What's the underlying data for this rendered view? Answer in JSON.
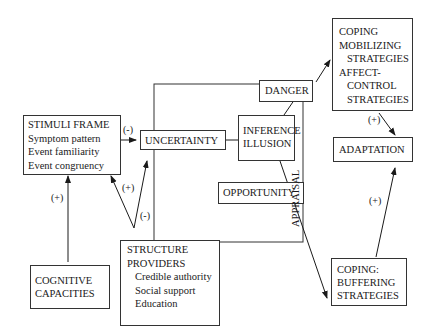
{
  "nodes": {
    "stimuli_frame": {
      "title": "STIMULI FRAME",
      "items": [
        "Symptom pattern",
        "Event familiarity",
        "Event congruency"
      ]
    },
    "uncertainty": {
      "label": "UNCERTAINTY"
    },
    "inference_illusion": {
      "lines": [
        "INFERENCE",
        "ILLUSION"
      ]
    },
    "danger": {
      "label": "DANGER"
    },
    "opportunity": {
      "label": "OPPORTUNITY"
    },
    "appraisal": {
      "label": "APPRAISAL"
    },
    "coping_mobilizing": {
      "lines": [
        "COPING",
        "MOBILIZING",
        "STRATEGIES",
        "AFFECT-",
        "CONTROL",
        "STRATEGIES"
      ]
    },
    "adaptation": {
      "label": "ADAPTATION"
    },
    "coping_buffering": {
      "lines": [
        "COPING:",
        "BUFFERING",
        "STRATEGIES"
      ]
    },
    "cognitive_capacities": {
      "lines": [
        "COGNITIVE",
        "CAPACITIES"
      ]
    },
    "structure_providers": {
      "title_lines": [
        "STRUCTURE",
        "PROVIDERS"
      ],
      "items": [
        "Credible authority",
        "Social support",
        "Education"
      ]
    }
  },
  "edge_labels": {
    "stimuli_to_uncertainty": "(-)",
    "structure_to_stimuli": "(+)",
    "structure_to_uncertainty": "(-)",
    "cognitive_to_stimuli": "(+)",
    "mobilizing_to_adaptation": "(+)",
    "buffering_to_adaptation": "(+)"
  }
}
